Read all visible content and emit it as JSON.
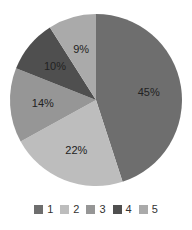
{
  "chart_data": {
    "type": "pie",
    "title": "",
    "categories": [
      "1",
      "2",
      "3",
      "4",
      "5"
    ],
    "values": [
      45,
      22,
      14,
      10,
      9
    ],
    "labels": [
      "45%",
      "22%",
      "14%",
      "10%",
      "9%"
    ],
    "colors": [
      "#6e6e6e",
      "#bdbdbd",
      "#969696",
      "#4f4f4f",
      "#aaaaaa"
    ],
    "start_angle_deg": 0,
    "direction": "clockwise",
    "legend_position": "bottom"
  },
  "legend": {
    "items": [
      {
        "label": "1",
        "color": "#6e6e6e"
      },
      {
        "label": "2",
        "color": "#bdbdbd"
      },
      {
        "label": "3",
        "color": "#969696"
      },
      {
        "label": "4",
        "color": "#4f4f4f"
      },
      {
        "label": "5",
        "color": "#aaaaaa"
      }
    ]
  }
}
